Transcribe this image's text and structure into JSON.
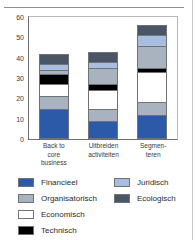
{
  "chart_data": {
    "type": "bar",
    "stacked": true,
    "title": "",
    "subtitle": "",
    "xlabel": "",
    "ylabel": "",
    "ylim": [
      0,
      60
    ],
    "yticks": [
      0,
      10,
      20,
      30,
      40,
      50,
      60
    ],
    "grid": false,
    "legend_position": "bottom",
    "categories": [
      "Back to core business",
      "Uitbreiden activiteiten",
      "Segmenteren"
    ],
    "category_label_lines": [
      [
        "Back to",
        "core",
        "business"
      ],
      [
        "Uitbreiden",
        "activiteiten"
      ],
      [
        "Segmen-",
        "teren"
      ]
    ],
    "series": [
      {
        "name": "Financieel",
        "color": "#2c5aa8",
        "values": [
          15,
          9,
          12
        ]
      },
      {
        "name": "Organisatorisch",
        "color": "#a9b3bf",
        "values": [
          6,
          6,
          6
        ]
      },
      {
        "name": "Economisch",
        "color": "#ffffff",
        "values": [
          6,
          9,
          15
        ]
      },
      {
        "name": "Technisch",
        "color": "#000000",
        "values": [
          5,
          3,
          2
        ]
      },
      {
        "name": "Organisatorisch",
        "color": "#a9b3bf",
        "values": [
          2,
          8,
          11
        ]
      },
      {
        "name": "Juridisch",
        "color": "#a8bee0",
        "values": [
          3,
          3,
          5
        ]
      },
      {
        "name": "Ecologisch",
        "color": "#4a5666",
        "values": [
          5,
          5,
          5
        ]
      }
    ],
    "totals": [
      42,
      46,
      56
    ]
  },
  "yaxis": {
    "ticks": [
      "0",
      "10",
      "20",
      "30",
      "40",
      "50",
      "60"
    ]
  },
  "legend": {
    "left_column": [
      {
        "label": "Financieel",
        "color": "#2c5aa8"
      },
      {
        "label": "Organisatorisch",
        "color": "#a9b3bf"
      },
      {
        "label": "Economisch",
        "color": "#ffffff"
      },
      {
        "label": "Technisch",
        "color": "#000000"
      }
    ],
    "right_column": [
      {
        "label": "Juridisch",
        "color": "#a8bee0"
      },
      {
        "label": "Ecologisch",
        "color": "#4a5666"
      }
    ]
  }
}
